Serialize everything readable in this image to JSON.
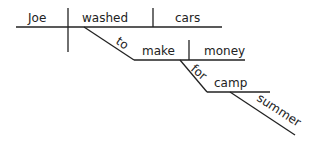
{
  "diagram": {
    "type": "sentence-diagram",
    "subject": "Joe",
    "verb": "washed",
    "direct_object": "cars",
    "infinitive_marker": "to",
    "infinitive_verb": "make",
    "infinitive_object": "money",
    "preposition": "for",
    "prep_object": "camp",
    "modifier": "summer",
    "colors": {
      "line": "#222222",
      "text": "#222222",
      "background": "#ffffff"
    }
  }
}
